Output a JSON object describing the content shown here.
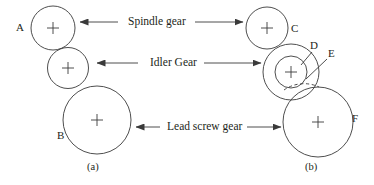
{
  "figure": {
    "type": "mechanical-gear-diagram",
    "background": "#ffffff",
    "stroke_color": "#3a3a3a",
    "text_color": "#231f20",
    "callouts": [
      {
        "id": "spindle",
        "text": "Spindle gear",
        "x": 128,
        "y": 16
      },
      {
        "id": "idler",
        "text": "Idler Gear",
        "x": 150,
        "y": 57
      },
      {
        "id": "leadscrew",
        "text": "Lead screw gear",
        "x": 167,
        "y": 121
      }
    ],
    "letters": [
      {
        "id": "A",
        "text": "A",
        "x": 16,
        "y": 22
      },
      {
        "id": "B",
        "text": "B",
        "x": 57,
        "y": 130
      },
      {
        "id": "C",
        "text": "C",
        "x": 291,
        "y": 23
      },
      {
        "id": "D",
        "text": "D",
        "x": 313,
        "y": 43
      },
      {
        "id": "E",
        "text": "E",
        "x": 329,
        "y": 51
      },
      {
        "id": "F",
        "text": "F",
        "x": 353,
        "y": 116
      }
    ],
    "subcaptions": [
      {
        "id": "a",
        "text": "(a)",
        "x": 88,
        "y": 164
      },
      {
        "id": "b",
        "text": "(b)",
        "x": 306,
        "y": 164
      }
    ],
    "panel_a": {
      "gears": [
        {
          "name": "spindle-gear-a",
          "cx": 53,
          "cy": 28,
          "r": 22
        },
        {
          "name": "idler-gear-a",
          "cx": 68,
          "cy": 68,
          "r": 20.5
        },
        {
          "name": "lead-screw-gear-a",
          "cx": 97,
          "cy": 120,
          "r": 34
        }
      ]
    },
    "panel_b": {
      "gears": [
        {
          "name": "spindle-gear-b",
          "cx": 267,
          "cy": 28,
          "r": 21
        },
        {
          "name": "idler-gear-b-outer",
          "cx": 291,
          "cy": 72,
          "r": 28
        },
        {
          "name": "idler-gear-b-inner",
          "cx": 291,
          "cy": 72,
          "r": 16
        },
        {
          "name": "lead-screw-gear-b",
          "cx": 318,
          "cy": 122,
          "r": 35
        }
      ]
    },
    "arrows": [
      {
        "name": "arrow-spindle-left",
        "x1": 118,
        "y1": 22,
        "x2": 78,
        "y2": 22,
        "dir": "left"
      },
      {
        "name": "arrow-spindle-right",
        "x1": 195,
        "y1": 22,
        "x2": 243,
        "y2": 22,
        "dir": "right"
      },
      {
        "name": "arrow-idler-left",
        "x1": 138,
        "y1": 63,
        "x2": 95,
        "y2": 63,
        "dir": "left"
      },
      {
        "name": "arrow-idler-right",
        "x1": 204,
        "y1": 63,
        "x2": 261,
        "y2": 63,
        "dir": "right"
      },
      {
        "name": "arrow-leadscrew-left",
        "x1": 160,
        "y1": 127,
        "x2": 133,
        "y2": 127,
        "dir": "left"
      },
      {
        "name": "arrow-leadscrew-right",
        "x1": 247,
        "y1": 127,
        "x2": 281,
        "y2": 127,
        "dir": "right"
      }
    ],
    "leader_lines": [
      {
        "name": "leader-D",
        "x1": 312,
        "y1": 52,
        "x2": 302,
        "y2": 64
      },
      {
        "name": "leader-E",
        "x1": 327,
        "y1": 59,
        "x2": 307,
        "y2": 78
      }
    ]
  }
}
